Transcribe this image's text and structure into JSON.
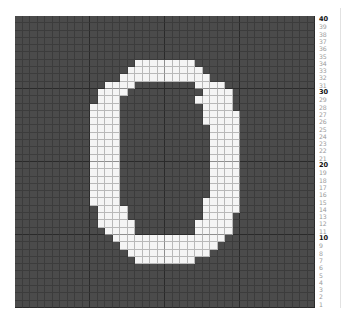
{
  "chart_data": {
    "type": "heatmap",
    "title": "",
    "rows": 40,
    "cols": 40,
    "row_labels_side": "right",
    "row_labels": [
      40,
      39,
      38,
      37,
      36,
      35,
      34,
      33,
      32,
      31,
      30,
      29,
      28,
      27,
      26,
      25,
      24,
      23,
      22,
      21,
      20,
      19,
      18,
      17,
      16,
      15,
      14,
      13,
      12,
      11,
      10,
      9,
      8,
      7,
      6,
      5,
      4,
      3,
      2,
      1
    ],
    "major_labels": [
      40,
      30,
      20,
      10
    ],
    "colors": {
      "background": "#4b4b4b",
      "foreground": "#f5f5f5"
    },
    "motif": "0",
    "filled_ranges_by_row_from_top": {
      "6": [
        [
          16,
          23
        ]
      ],
      "7": [
        [
          15,
          24
        ]
      ],
      "8": [
        [
          14,
          25
        ]
      ],
      "9": [
        [
          12,
          15
        ],
        [
          24,
          27
        ]
      ],
      "10": [
        [
          11,
          14
        ],
        [
          25,
          28
        ]
      ],
      "11": [
        [
          11,
          13
        ],
        [
          24,
          28
        ]
      ],
      "12": [
        [
          10,
          13
        ],
        [
          25,
          28
        ]
      ],
      "13": [
        [
          10,
          13
        ],
        [
          25,
          29
        ]
      ],
      "14": [
        [
          10,
          13
        ],
        [
          25,
          29
        ]
      ],
      "15": [
        [
          10,
          13
        ],
        [
          26,
          29
        ]
      ],
      "16": [
        [
          10,
          13
        ],
        [
          26,
          29
        ]
      ],
      "17": [
        [
          10,
          13
        ],
        [
          26,
          29
        ]
      ],
      "18": [
        [
          10,
          13
        ],
        [
          26,
          29
        ]
      ],
      "19": [
        [
          10,
          13
        ],
        [
          26,
          29
        ]
      ],
      "20": [
        [
          10,
          13
        ],
        [
          26,
          29
        ]
      ],
      "21": [
        [
          10,
          13
        ],
        [
          26,
          29
        ]
      ],
      "22": [
        [
          10,
          13
        ],
        [
          26,
          29
        ]
      ],
      "23": [
        [
          10,
          13
        ],
        [
          26,
          29
        ]
      ],
      "24": [
        [
          10,
          13
        ],
        [
          26,
          29
        ]
      ],
      "25": [
        [
          10,
          13
        ],
        [
          25,
          29
        ]
      ],
      "26": [
        [
          11,
          14
        ],
        [
          25,
          29
        ]
      ],
      "27": [
        [
          11,
          14
        ],
        [
          25,
          28
        ]
      ],
      "28": [
        [
          11,
          15
        ],
        [
          24,
          28
        ]
      ],
      "29": [
        [
          12,
          15
        ],
        [
          24,
          28
        ]
      ],
      "30": [
        [
          13,
          27
        ]
      ],
      "31": [
        [
          14,
          26
        ]
      ],
      "32": [
        [
          15,
          25
        ]
      ],
      "33": [
        [
          16,
          23
        ]
      ]
    }
  }
}
